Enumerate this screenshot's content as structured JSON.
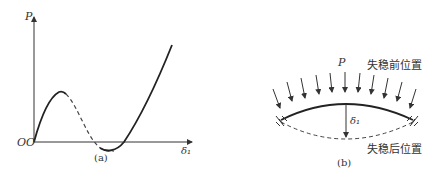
{
  "figure_a": {
    "caption": "(a)",
    "y_axis_label": "P",
    "x_axis_label": "δ₁",
    "origin_label": "OO"
  },
  "figure_b": {
    "caption": "(b)",
    "load_label": "P",
    "deflection_label": "δ₁",
    "before_buckling_label": "失稳前位置",
    "after_buckling_label": "失稳后位置"
  }
}
